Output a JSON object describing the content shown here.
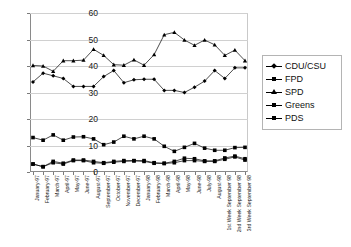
{
  "chart_data": {
    "type": "line",
    "title": "",
    "xlabel": "",
    "ylabel": "",
    "ylim": [
      0,
      60
    ],
    "yticks": [
      0,
      10,
      20,
      30,
      40,
      50,
      60
    ],
    "grid": true,
    "legend_position": "right",
    "categories": [
      "January-97",
      "February-97",
      "March-97",
      "April-97",
      "May-97",
      "June-97",
      "August-97",
      "September-97",
      "October-97",
      "November-97",
      "December-97",
      "January-98",
      "February-98",
      "March-98",
      "April-98",
      "May-98",
      "June-98",
      "July-98",
      "August-98",
      "1st Week September 98",
      "2nd Week September 98",
      "3rd Week September 98"
    ],
    "series": [
      {
        "name": "CDU/CSU",
        "marker": "diamond",
        "values": [
          34.0,
          37.3,
          36.3,
          35.3,
          32.3,
          32.3,
          32.3,
          36.0,
          38.3,
          33.7,
          34.8,
          35.0,
          35.0,
          30.8,
          30.8,
          30.0,
          32.0,
          34.3,
          38.3,
          35.3,
          39.3,
          39.3
        ]
      },
      {
        "name": "FPD",
        "marker": "square",
        "values": [
          3.0,
          2.0,
          4.0,
          3.3,
          4.5,
          4.5,
          4.0,
          3.5,
          4.0,
          4.3,
          4.3,
          4.3,
          3.5,
          3.3,
          4.0,
          5.2,
          5.0,
          4.2,
          4.2,
          5.3,
          6.0,
          5.0
        ]
      },
      {
        "name": "SPD",
        "marker": "triangle",
        "values": [
          40.2,
          40.0,
          38.0,
          42.0,
          42.0,
          42.2,
          46.3,
          44.0,
          40.5,
          40.3,
          42.3,
          40.3,
          44.3,
          51.8,
          52.7,
          49.8,
          47.8,
          49.8,
          48.0,
          44.0,
          46.0,
          42.0
        ]
      },
      {
        "name": "Greens",
        "marker": "square",
        "values": [
          13.0,
          12.0,
          14.0,
          12.0,
          13.2,
          13.3,
          12.5,
          10.3,
          11.3,
          13.5,
          12.5,
          13.5,
          12.5,
          9.7,
          7.8,
          9.3,
          10.8,
          9.0,
          8.2,
          8.2,
          9.2,
          9.3
        ]
      },
      {
        "name": "PDS",
        "marker": "square",
        "values": [
          3.0,
          2.0,
          3.5,
          3.0,
          4.3,
          4.3,
          3.5,
          3.3,
          3.7,
          4.0,
          4.2,
          4.0,
          3.3,
          3.2,
          3.5,
          4.3,
          4.3,
          4.0,
          4.0,
          4.8,
          5.7,
          4.5
        ]
      }
    ]
  },
  "legend": {
    "items": [
      {
        "label": "CDU/CSU",
        "marker": "diamond"
      },
      {
        "label": "FPD",
        "marker": "square"
      },
      {
        "label": "SPD",
        "marker": "triangle"
      },
      {
        "label": "Greens",
        "marker": "square"
      },
      {
        "label": "PDS",
        "marker": "square"
      }
    ]
  }
}
